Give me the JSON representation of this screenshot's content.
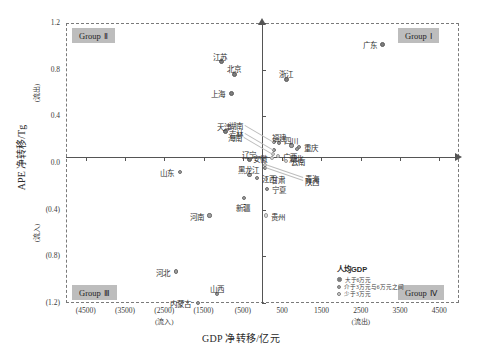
{
  "chart_data": {
    "type": "scatter",
    "title": "",
    "xlabel": "GDP 净转移/亿元",
    "ylabel": "APE 净转移/Tg",
    "xlim": [
      -5000,
      5000
    ],
    "ylim": [
      -1.2,
      1.2
    ],
    "grid": false,
    "x_ticks": [
      "(4500)",
      "(3500)",
      "(2500)",
      "(1500)",
      "(500)",
      "500",
      "1500",
      "2500",
      "3500",
      "4500"
    ],
    "x_tick_values": [
      -4500,
      -3500,
      -2500,
      -1500,
      -500,
      500,
      1500,
      2500,
      3500,
      4500
    ],
    "y_ticks": [
      "1.2",
      "0.8",
      "0.4",
      "0.0",
      "(0.4)",
      "(0.8)",
      "(1.2)"
    ],
    "y_tick_values": [
      1.2,
      0.8,
      0.4,
      0.0,
      -0.4,
      -0.8,
      -1.2
    ],
    "x_inflow_note": "(流入)",
    "x_outflow_note": "(流出)",
    "y_outflow_note": "(流出)",
    "y_inflow_note": "(流入)",
    "quadrants": [
      {
        "id": "group-1",
        "label": "Group",
        "numeral": "Ⅰ",
        "position": "top-right"
      },
      {
        "id": "group-2",
        "label": "Group",
        "numeral": "Ⅱ",
        "position": "top-left"
      },
      {
        "id": "group-3",
        "label": "Group",
        "numeral": "Ⅲ",
        "position": "bottom-left"
      },
      {
        "id": "group-4",
        "label": "Group",
        "numeral": "Ⅳ",
        "position": "bottom-right"
      }
    ],
    "legend": {
      "title": "人均GDP",
      "position": "bottom-right-inside",
      "entries": [
        {
          "key": "high",
          "label": "大于6万元",
          "color": "#7d7d7d"
        },
        {
          "key": "mid",
          "label": "介于3万元与6万元之间",
          "color": "#a0a0a0"
        },
        {
          "key": "low",
          "label": "少于3万元",
          "color": "#dcdcdc"
        }
      ]
    },
    "points": [
      {
        "name": "广东",
        "x": 3050,
        "y": 1.02,
        "size": "high",
        "label_pos": "left"
      },
      {
        "name": "江苏",
        "x": -1050,
        "y": 0.87,
        "size": "high",
        "label_pos": "above"
      },
      {
        "name": "北京",
        "x": -700,
        "y": 0.76,
        "size": "high",
        "label_pos": "above"
      },
      {
        "name": "浙江",
        "x": 620,
        "y": 0.72,
        "size": "high",
        "label_pos": "above"
      },
      {
        "name": "上海",
        "x": -800,
        "y": 0.6,
        "size": "high",
        "label_pos": "left"
      },
      {
        "name": "天津",
        "x": -950,
        "y": 0.27,
        "size": "high",
        "label_pos": "above"
      },
      {
        "name": "辽宁",
        "x": -330,
        "y": 0.03,
        "size": "high",
        "label_pos": "above"
      },
      {
        "name": "湖南",
        "x": 300,
        "y": 0.18,
        "size": "mid",
        "label_pos": "leader-left"
      },
      {
        "name": "福建",
        "x": 430,
        "y": 0.17,
        "size": "mid",
        "label_pos": "above"
      },
      {
        "name": "四川",
        "x": 740,
        "y": 0.15,
        "size": "mid",
        "label_pos": "above"
      },
      {
        "name": "重庆",
        "x": 930,
        "y": 0.14,
        "size": "mid",
        "label_pos": "right"
      },
      {
        "name": "湖北",
        "x": 880,
        "y": 0.12,
        "size": "mid",
        "label_pos": "below"
      },
      {
        "name": "吉林",
        "x": 300,
        "y": 0.11,
        "size": "mid",
        "label_pos": "leader-left"
      },
      {
        "name": "海南",
        "x": 275,
        "y": 0.08,
        "size": "low",
        "label_pos": "leader-left"
      },
      {
        "name": "广西",
        "x": 390,
        "y": 0.06,
        "size": "low",
        "label_pos": "right"
      },
      {
        "name": "安徽",
        "x": 250,
        "y": 0.04,
        "size": "low",
        "label_pos": "left"
      },
      {
        "name": "云南",
        "x": 600,
        "y": 0.02,
        "size": "low",
        "label_pos": "right"
      },
      {
        "name": "青海",
        "x": 60,
        "y": -0.02,
        "size": "low",
        "label_pos": "leader-right"
      },
      {
        "name": "陕西",
        "x": 70,
        "y": -0.04,
        "size": "mid",
        "label_pos": "leader-right"
      },
      {
        "name": "甘肃",
        "x": 90,
        "y": -0.14,
        "size": "low",
        "label_pos": "right"
      },
      {
        "name": "宁夏",
        "x": 110,
        "y": -0.22,
        "size": "mid",
        "label_pos": "right"
      },
      {
        "name": "贵州",
        "x": 95,
        "y": -0.45,
        "size": "low",
        "label_pos": "right"
      },
      {
        "name": "江西",
        "x": -140,
        "y": -0.13,
        "size": "mid",
        "label_pos": "right"
      },
      {
        "name": "新疆",
        "x": -480,
        "y": -0.3,
        "size": "mid",
        "label_pos": "below"
      },
      {
        "name": "黑龙江",
        "x": -330,
        "y": -0.1,
        "size": "mid",
        "label_pos": "above"
      },
      {
        "name": "山东",
        "x": -2100,
        "y": -0.08,
        "size": "mid",
        "label_pos": "left"
      },
      {
        "name": "河南",
        "x": -1350,
        "y": -0.45,
        "size": "mid",
        "label_pos": "left"
      },
      {
        "name": "河北",
        "x": -2200,
        "y": -0.93,
        "size": "mid",
        "label_pos": "left"
      },
      {
        "name": "山西",
        "x": -1150,
        "y": -1.12,
        "size": "mid",
        "label_pos": "above"
      },
      {
        "name": "内蒙古",
        "x": -1650,
        "y": -1.2,
        "size": "mid",
        "label_pos": "left"
      }
    ]
  }
}
